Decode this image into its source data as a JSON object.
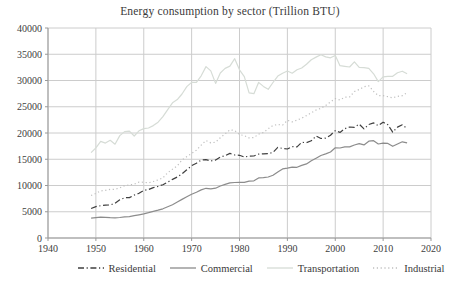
{
  "chart_data": {
    "type": "line",
    "title": "Energy consumption by sector (Trillion BTU)",
    "xlabel": "",
    "ylabel": "",
    "x_range": [
      1940,
      2020
    ],
    "y_range": [
      0,
      40000
    ],
    "x_ticks": [
      1940,
      1950,
      1960,
      1970,
      1980,
      1990,
      2000,
      2010,
      2020
    ],
    "y_ticks": [
      0,
      5000,
      10000,
      15000,
      20000,
      25000,
      30000,
      35000,
      40000
    ],
    "grid": true,
    "legend_position": "bottom",
    "years": [
      1949,
      1950,
      1951,
      1952,
      1953,
      1954,
      1955,
      1956,
      1957,
      1958,
      1959,
      1960,
      1961,
      1962,
      1963,
      1964,
      1965,
      1966,
      1967,
      1968,
      1969,
      1970,
      1971,
      1972,
      1973,
      1974,
      1975,
      1976,
      1977,
      1978,
      1979,
      1980,
      1981,
      1982,
      1983,
      1984,
      1985,
      1986,
      1987,
      1988,
      1989,
      1990,
      1991,
      1992,
      1993,
      1994,
      1995,
      1996,
      1997,
      1998,
      1999,
      2000,
      2001,
      2002,
      2003,
      2004,
      2005,
      2006,
      2007,
      2008,
      2009,
      2010,
      2011,
      2012,
      2013,
      2014,
      2015
    ],
    "series": [
      {
        "name": "Residential",
        "style": "dashdot",
        "color": "#3f3f3f",
        "values": [
          5610,
          5989,
          6151,
          6267,
          6283,
          6632,
          7278,
          7670,
          7699,
          8168,
          8523,
          9039,
          9245,
          9605,
          9852,
          10144,
          10640,
          11163,
          11625,
          12200,
          12986,
          13766,
          14245,
          14847,
          14933,
          14686,
          14842,
          15437,
          15667,
          16117,
          15819,
          15753,
          15434,
          15575,
          15616,
          15990,
          16041,
          16049,
          16316,
          17250,
          17060,
          16944,
          17413,
          17354,
          18222,
          18157,
          18519,
          19435,
          18957,
          19022,
          19583,
          20448,
          20113,
          20823,
          21143,
          21082,
          21697,
          20790,
          21622,
          21919,
          21388,
          22062,
          21556,
          20160,
          21127,
          21563,
          20872
        ]
      },
      {
        "name": "Commercial",
        "style": "solid",
        "color": "#8c8c8c",
        "values": [
          3780,
          3890,
          3960,
          3920,
          3870,
          3840,
          3900,
          4040,
          4060,
          4250,
          4420,
          4610,
          4810,
          5060,
          5290,
          5560,
          5950,
          6350,
          6850,
          7350,
          7850,
          8350,
          8710,
          9160,
          9470,
          9380,
          9490,
          9910,
          10200,
          10500,
          10580,
          10590,
          10600,
          10840,
          10890,
          11440,
          11500,
          11610,
          11940,
          12590,
          13160,
          13320,
          13500,
          13460,
          13830,
          14110,
          14700,
          15200,
          15720,
          16010,
          16380,
          17180,
          17140,
          17370,
          17350,
          17720,
          17970,
          17730,
          18430,
          18540,
          17910,
          18060,
          18020,
          17470,
          17900,
          18320,
          18130
        ]
      },
      {
        "name": "Transportation",
        "style": "solid",
        "color": "#d6dcd6",
        "values": [
          16240,
          17170,
          18400,
          18070,
          18610,
          17870,
          19500,
          20260,
          20350,
          19430,
          20420,
          20840,
          20960,
          21400,
          22060,
          23110,
          24450,
          25750,
          26360,
          27430,
          28830,
          29640,
          29660,
          30900,
          32650,
          31820,
          29450,
          31430,
          32310,
          32740,
          34160,
          32040,
          30750,
          27660,
          27480,
          29640,
          28880,
          28330,
          29620,
          30840,
          31400,
          31810,
          31390,
          32050,
          32380,
          33110,
          33970,
          34460,
          34920,
          34490,
          34330,
          34760,
          32810,
          32690,
          32570,
          33570,
          32520,
          32440,
          32310,
          31270,
          29800,
          30700,
          30800,
          30800,
          31480,
          31780,
          31300
        ]
      },
      {
        "name": "Industrial",
        "style": "dotted",
        "color": "#bfbfbf",
        "values": [
          8100,
          8490,
          8970,
          9060,
          9270,
          9280,
          9550,
          9990,
          10120,
          10250,
          10640,
          10600,
          10520,
          10770,
          11070,
          11440,
          12430,
          13100,
          13750,
          14860,
          15500,
          16090,
          16720,
          17700,
          18580,
          18120,
          18240,
          19100,
          19820,
          20610,
          20470,
          19700,
          19510,
          19070,
          19130,
          19800,
          20090,
          20810,
          21450,
          21610,
          21500,
          22420,
          22120,
          22460,
          22810,
          23310,
          23850,
          24390,
          24700,
          25260,
          25920,
          26550,
          26280,
          26810,
          26860,
          27900,
          28280,
          28800,
          29000,
          27920,
          27120,
          27100,
          26910,
          26700,
          26970,
          27110,
          27700
        ]
      }
    ],
    "colors": {
      "background": "#ffffff",
      "grid": "#cccccc",
      "axis": "#999999",
      "text": "#404040"
    }
  }
}
